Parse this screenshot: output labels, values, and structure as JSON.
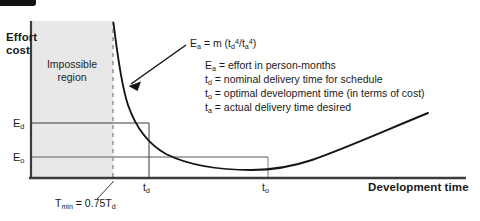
{
  "figure": {
    "type": "line-chart-diagram",
    "axes": {
      "y_title_line1": "Effort",
      "y_title_line2": "cost",
      "x_title": "Development time",
      "y_ticks": [
        {
          "label_main": "E",
          "label_sub": "d"
        },
        {
          "label_main": "E",
          "label_sub": "o"
        }
      ],
      "x_ticks": [
        {
          "label_main": "t",
          "label_sub": "d"
        },
        {
          "label_main": "t",
          "label_sub": "o"
        }
      ]
    },
    "shaded_region": {
      "line1": "Impossible",
      "line2": "region",
      "fill_color": "#e8e8e8"
    },
    "formula": {
      "lhs_main": "E",
      "lhs_sub": "a",
      "eq": " = m (t",
      "num_sub": "d",
      "num_sup": "4",
      "slash": "/t",
      "den_sub": "a",
      "den_sup": "4",
      "close": ")"
    },
    "legend": [
      {
        "symbol_main": "E",
        "symbol_sub": "a",
        "text": " = effort in person-months"
      },
      {
        "symbol_main": "t",
        "symbol_sub": "d",
        "text": " = nominal delivery time for schedule"
      },
      {
        "symbol_main": "t",
        "symbol_sub": "o",
        "text": " = optimal development time (in terms of cost)"
      },
      {
        "symbol_main": "t",
        "symbol_sub": "a",
        "text": " = actual delivery time desired"
      }
    ],
    "annotation": {
      "main": "T",
      "sub": "min",
      "eq": " = 0.75T",
      "tail_sub": "d"
    },
    "colors": {
      "curve": "#151515",
      "axis": "#3b3b3b",
      "shade": "#e8e8e8",
      "guide_dark": "#3b3b3b",
      "guide_gray": "#8e8e8e",
      "dashed": "#9a9a9a",
      "accent_bar": "#111111"
    }
  }
}
